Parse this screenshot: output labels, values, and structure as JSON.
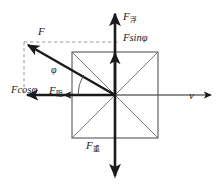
{
  "figure": {
    "type": "physics-free-body-diagram",
    "width": 221,
    "height": 192,
    "background_color": "#ffffff"
  },
  "colors": {
    "axis": "#6b6b6b",
    "solid_vector": "#1a1a1a",
    "box_outline": "#555555",
    "box_diagonal": "#6f6f6f",
    "dashed_guide": "#9a9a9a",
    "label_text": "#222222"
  },
  "labels": {
    "force_buoyancy": {
      "symbol": "F",
      "subscript": "浮",
      "text": "F浮"
    },
    "force_sin_component": {
      "text": "Fsinφ",
      "base": "F",
      "fn": "sin",
      "angle": "φ"
    },
    "force_resultant": {
      "symbol": "F",
      "text": "F"
    },
    "angle": {
      "text": "φ"
    },
    "force_cos_component": {
      "text": "Fcosφ",
      "base": "F",
      "fn": "cos",
      "angle": "φ"
    },
    "force_drag": {
      "symbol": "F",
      "subscript": "阻",
      "text": "F阻"
    },
    "velocity": {
      "text": "v"
    },
    "force_gravity": {
      "symbol": "F",
      "subscript": "重",
      "text": "F重"
    }
  },
  "geometry": {
    "origin": {
      "x": 115,
      "y": 95
    },
    "box": {
      "left": 72,
      "top": 52,
      "right": 158,
      "bottom": 138
    },
    "vectors": [
      {
        "name": "buoyancy-up",
        "from": [
          115,
          95
        ],
        "to": [
          115,
          10
        ],
        "style": "solid"
      },
      {
        "name": "gravity-down",
        "from": [
          115,
          95
        ],
        "to": [
          115,
          181
        ],
        "style": "solid"
      },
      {
        "name": "velocity-right",
        "from": [
          115,
          95
        ],
        "to": [
          213,
          95
        ],
        "style": "solid-axis"
      },
      {
        "name": "drag-left",
        "from": [
          115,
          95
        ],
        "to": [
          32,
          95
        ],
        "style": "solid-axis"
      },
      {
        "name": "resultant",
        "from": [
          115,
          95
        ],
        "to": [
          28,
          45
        ],
        "style": "solid"
      },
      {
        "name": "cos-component",
        "from": [
          115,
          95
        ],
        "to": [
          24,
          95
        ],
        "style": "solid"
      },
      {
        "name": "sin-component",
        "from": [
          115,
          95
        ],
        "to": [
          115,
          48
        ],
        "style": "solid"
      }
    ],
    "dashed_guides": [
      {
        "name": "horizontal-top",
        "from": [
          24,
          42
        ],
        "to": [
          115,
          42
        ]
      },
      {
        "name": "vertical-left",
        "from": [
          24,
          42
        ],
        "to": [
          24,
          95
        ]
      }
    ]
  }
}
